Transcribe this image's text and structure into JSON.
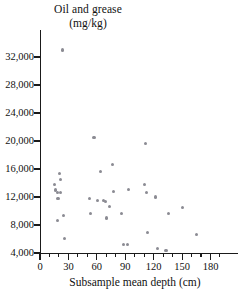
{
  "chart_data": {
    "type": "scatter",
    "title": "Oil and grease (mg/kg)",
    "title_lines": [
      "Oil and grease",
      "(mg/kg)"
    ],
    "xlabel": "Subsample mean depth (cm)",
    "ylabel": "Oil and grease (mg/kg)",
    "xlim": [
      0,
      190
    ],
    "ylim": [
      4000,
      34000
    ],
    "grid": false,
    "legend": false,
    "x_ticks": [
      0,
      30,
      60,
      90,
      120,
      150,
      180
    ],
    "x_tick_labels": [
      "0",
      "30",
      "60",
      "90",
      "120",
      "150",
      "180"
    ],
    "x_minor_tick_step": 10,
    "y_ticks": [
      4000,
      8000,
      12000,
      16000,
      20000,
      24000,
      28000,
      32000
    ],
    "y_tick_labels": [
      "4,000",
      "8,000",
      "12,000",
      "16,000",
      "20,000",
      "24,000",
      "28,000",
      "32,000"
    ],
    "marker_color": "#8b8b93",
    "axis_color": "#1a1a1a",
    "points": [
      {
        "x": 24,
        "y": 33000
      },
      {
        "x": 15,
        "y": 13800
      },
      {
        "x": 16,
        "y": 13000
      },
      {
        "x": 18,
        "y": 12600
      },
      {
        "x": 19,
        "y": 11800
      },
      {
        "x": 18,
        "y": 8600
      },
      {
        "x": 21,
        "y": 15300
      },
      {
        "x": 22,
        "y": 14500
      },
      {
        "x": 22,
        "y": 12700
      },
      {
        "x": 25,
        "y": 9400
      },
      {
        "x": 26,
        "y": 6100
      },
      {
        "x": 52,
        "y": 11800
      },
      {
        "x": 53,
        "y": 9600
      },
      {
        "x": 57,
        "y": 20500
      },
      {
        "x": 61,
        "y": 11500
      },
      {
        "x": 64,
        "y": 15700
      },
      {
        "x": 67,
        "y": 11500
      },
      {
        "x": 69,
        "y": 11400
      },
      {
        "x": 70,
        "y": 9000
      },
      {
        "x": 73,
        "y": 10700
      },
      {
        "x": 77,
        "y": 16600
      },
      {
        "x": 78,
        "y": 12800
      },
      {
        "x": 86,
        "y": 9600
      },
      {
        "x": 88,
        "y": 5200
      },
      {
        "x": 92,
        "y": 5200
      },
      {
        "x": 93,
        "y": 13100
      },
      {
        "x": 110,
        "y": 13800
      },
      {
        "x": 111,
        "y": 19700
      },
      {
        "x": 112,
        "y": 12600
      },
      {
        "x": 113,
        "y": 6900
      },
      {
        "x": 122,
        "y": 12000
      },
      {
        "x": 124,
        "y": 4700
      },
      {
        "x": 133,
        "y": 4300
      },
      {
        "x": 136,
        "y": 9600
      },
      {
        "x": 150,
        "y": 10500
      },
      {
        "x": 165,
        "y": 6600
      }
    ]
  }
}
